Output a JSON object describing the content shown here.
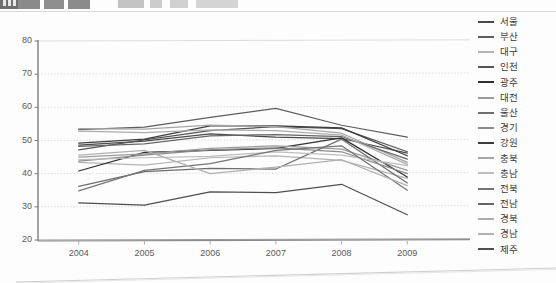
{
  "chart_data": {
    "type": "line",
    "title": "",
    "xlabel": "",
    "ylabel": "",
    "x": [
      "2004",
      "2005",
      "2006",
      "2007",
      "2008",
      "2009"
    ],
    "categories": [
      "2004",
      "2005",
      "2006",
      "2007",
      "2008",
      "2009"
    ],
    "ylim": [
      20,
      80
    ],
    "yticks": [
      20,
      30,
      40,
      50,
      60,
      70,
      80
    ],
    "grid": true,
    "legend_position": "right",
    "series": [
      {
        "name": "서울",
        "color": "#4a4a4a",
        "values": [
          48.6,
          49.8,
          52.0,
          51.0,
          50.6,
          46.2
        ]
      },
      {
        "name": "부산",
        "color": "#5d5d5d",
        "values": [
          53.3,
          54.0,
          57.0,
          59.7,
          54.6,
          51.0
        ]
      },
      {
        "name": "대구",
        "color": "#b4b4b4",
        "values": [
          43.4,
          42.6,
          44.8,
          45.4,
          44.0,
          38.6
        ]
      },
      {
        "name": "인천",
        "color": "#555555",
        "values": [
          47.2,
          50.2,
          53.0,
          54.2,
          53.6,
          46.6
        ]
      },
      {
        "name": "광주",
        "color": "#2f2f2f",
        "values": [
          40.8,
          46.4,
          47.0,
          47.6,
          50.8,
          39.0
        ]
      },
      {
        "name": "대전",
        "color": "#9a9a9a",
        "values": [
          45.0,
          46.0,
          47.6,
          48.4,
          47.4,
          41.0
        ]
      },
      {
        "name": "울산",
        "color": "#6e6e6e",
        "values": [
          36.2,
          40.6,
          41.6,
          41.4,
          50.4,
          37.2
        ]
      },
      {
        "name": "경기",
        "color": "#8a8a8a",
        "values": [
          43.8,
          45.6,
          47.2,
          47.8,
          46.6,
          40.0
        ]
      },
      {
        "name": "강원",
        "color": "#3c3c3c",
        "values": [
          49.2,
          50.4,
          54.4,
          54.4,
          53.8,
          45.4
        ]
      },
      {
        "name": "충북",
        "color": "#a6a6a6",
        "values": [
          53.6,
          53.4,
          54.6,
          54.2,
          52.2,
          43.4
        ]
      },
      {
        "name": "충남",
        "color": "#bdbdbd",
        "values": [
          44.2,
          44.8,
          45.2,
          46.6,
          45.6,
          42.4
        ]
      },
      {
        "name": "전북",
        "color": "#747474",
        "values": [
          34.8,
          41.0,
          43.0,
          47.0,
          48.4,
          35.0
        ]
      },
      {
        "name": "전남",
        "color": "#666666",
        "values": [
          48.2,
          49.0,
          51.4,
          51.8,
          51.2,
          44.4
        ]
      },
      {
        "name": "경북",
        "color": "#acacac",
        "values": [
          52.8,
          52.4,
          53.2,
          53.0,
          51.6,
          42.8
        ]
      },
      {
        "name": "경남",
        "color": "#b0b0b0",
        "values": [
          45.6,
          47.0,
          40.0,
          42.0,
          44.2,
          36.4
        ]
      },
      {
        "name": "제주",
        "color": "#4f4f4f",
        "values": [
          31.2,
          30.5,
          34.5,
          34.3,
          36.8,
          27.6
        ]
      }
    ]
  },
  "legend": {
    "items": [
      {
        "label": "서울"
      },
      {
        "label": "부산"
      },
      {
        "label": "대구"
      },
      {
        "label": "인천"
      },
      {
        "label": "광주"
      },
      {
        "label": "대전"
      },
      {
        "label": "울산"
      },
      {
        "label": "경기"
      },
      {
        "label": "강원"
      },
      {
        "label": "충북"
      },
      {
        "label": "충남"
      },
      {
        "label": "전북"
      },
      {
        "label": "전남"
      },
      {
        "label": "경북"
      },
      {
        "label": "경남"
      },
      {
        "label": "제주"
      }
    ]
  },
  "axes": {
    "y_tick_labels": [
      "80",
      "70",
      "60",
      "50",
      "40",
      "30",
      "20"
    ],
    "x_tick_labels": [
      "2004",
      "2005",
      "2006",
      "2007",
      "2008",
      "2009"
    ]
  }
}
